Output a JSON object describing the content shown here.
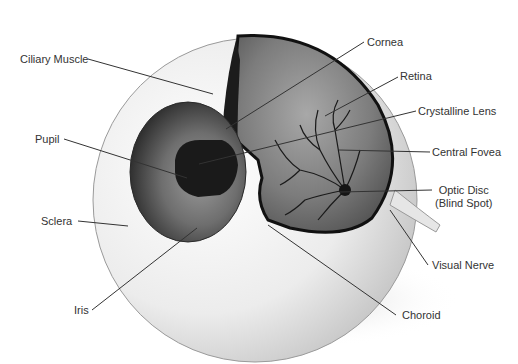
{
  "labels": {
    "ciliary_muscle": "Ciliary Muscle",
    "cornea": "Cornea",
    "retina": "Retina",
    "crystalline_lens": "Crystalline Lens",
    "pupil": "Pupil",
    "central_fovea": "Central Fovea",
    "optic_disc_line1": "Optic Disc",
    "optic_disc_line2": "(Blind Spot)",
    "sclera": "Sclera",
    "visual_nerve": "Visual Nerve",
    "iris": "Iris",
    "choroid": "Choroid"
  },
  "colors": {
    "background": "#ffffff",
    "sclera": "#e8e8e8",
    "interior": "#6a6a6a",
    "vessels": "#1a1a1a",
    "leader_lines": "#333333",
    "text": "#333333"
  }
}
